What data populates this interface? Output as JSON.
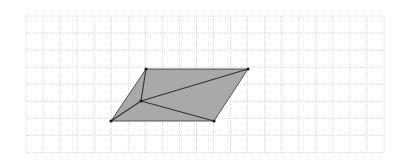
{
  "diagram": {
    "type": "geometry-grid",
    "background": "#ffffff",
    "grid": {
      "x0": 26,
      "y0": 16,
      "step": 17.05,
      "cols": 21,
      "rows": 8,
      "color": "#d8d8d8",
      "dash": "1,1"
    },
    "shape": {
      "name": "parallelogram",
      "fill": "#a9a9a9",
      "stroke": "#333333",
      "vertices": [
        {
          "label": "bottom-left",
          "x": 111,
          "y": 121
        },
        {
          "label": "top-left",
          "x": 146,
          "y": 69
        },
        {
          "label": "top-right",
          "x": 248,
          "y": 69
        },
        {
          "label": "bottom-right",
          "x": 214,
          "y": 121
        }
      ],
      "interior_point": {
        "label": "interior",
        "x": 141,
        "y": 101
      },
      "segments": [
        {
          "from": "interior",
          "to": "bottom-left"
        },
        {
          "from": "interior",
          "to": "top-left"
        },
        {
          "from": "interior",
          "to": "top-right"
        },
        {
          "from": "interior",
          "to": "bottom-right"
        }
      ],
      "point_color": "#1a1a1a"
    }
  }
}
